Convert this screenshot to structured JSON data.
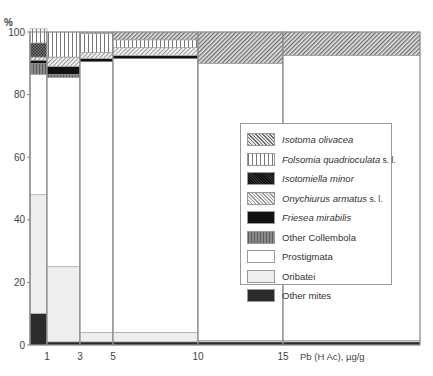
{
  "chart_data": {
    "type": "bar",
    "subtype": "stacked-100-percent-variable-width",
    "title": "",
    "ylabel": "%",
    "xlabel": "Pb (H Ac), µg/g",
    "ylim": [
      0,
      100
    ],
    "yticks": [
      0,
      20,
      40,
      60,
      80,
      100
    ],
    "xticks": [
      "1",
      "3",
      "5",
      "10",
      "15"
    ],
    "grid": false,
    "legend_position": "inside-right",
    "bars": [
      {
        "x_from": 0,
        "x_to": 1,
        "segments": {
          "Other mites": 10,
          "Oribatei": 38,
          "Prostigmata": 38.5,
          "Other Collembola": 3.5,
          "Friesea mirabilis": 1,
          "Onychiurus armatus s. l.": 1,
          "Isotomiella minor": 4.5,
          "Folsomia quadrioculata s. l.": 4.5,
          "Isotoma olivacea": 0
        }
      },
      {
        "x_from": 1,
        "x_to": 3,
        "segments": {
          "Other mites": 1,
          "Oribatei": 24,
          "Prostigmata": 60.5,
          "Other Collembola": 1,
          "Friesea mirabilis": 2.5,
          "Onychiurus armatus s. l.": 3,
          "Isotomiella minor": 0,
          "Folsomia quadrioculata s. l.": 8,
          "Isotoma olivacea": 0
        }
      },
      {
        "x_from": 3,
        "x_to": 5,
        "segments": {
          "Other mites": 1,
          "Oribatei": 3,
          "Prostigmata": 86.5,
          "Other Collembola": 0,
          "Friesea mirabilis": 1,
          "Onychiurus armatus s. l.": 2,
          "Isotomiella minor": 0,
          "Folsomia quadrioculata s. l.": 6,
          "Isotoma olivacea": 0.5
        }
      },
      {
        "x_from": 5,
        "x_to": 10,
        "segments": {
          "Other mites": 1,
          "Oribatei": 3,
          "Prostigmata": 87.5,
          "Other Collembola": 0,
          "Friesea mirabilis": 1,
          "Onychiurus armatus s. l.": 2.5,
          "Isotomiella minor": 0,
          "Folsomia quadrioculata s. l.": 2.5,
          "Isotoma olivacea": 2.5
        }
      },
      {
        "x_from": 10,
        "x_to": 15,
        "segments": {
          "Other mites": 1,
          "Oribatei": 0.5,
          "Prostigmata": 88.5,
          "Other Collembola": 0,
          "Friesea mirabilis": 0,
          "Onychiurus armatus s. l.": 0,
          "Isotomiella minor": 0,
          "Folsomia quadrioculata s. l.": 0,
          "Isotoma olivacea": 10
        }
      },
      {
        "x_from": 15,
        "x_to": 20,
        "segments": {
          "Other mites": 1,
          "Oribatei": 0.5,
          "Prostigmata": 91,
          "Other Collembola": 0,
          "Friesea mirabilis": 0,
          "Onychiurus armatus s. l.": 0,
          "Isotomiella minor": 0,
          "Folsomia quadrioculata s. l.": 0,
          "Isotoma olivacea": 7.5
        }
      }
    ],
    "series_order_bottom_to_top": [
      "Other mites",
      "Oribatei",
      "Prostigmata",
      "Other Collembola",
      "Friesea mirabilis",
      "Onychiurus armatus s. l.",
      "Isotomiella minor",
      "Folsomia quadrioculata s. l.",
      "Isotoma olivacea"
    ]
  },
  "axis": {
    "y_unit": "%",
    "y_ticks": [
      "0",
      "20",
      "40",
      "60",
      "80",
      "100"
    ],
    "x_ticks": [
      "1",
      "3",
      "5",
      "10",
      "15"
    ],
    "x_title": "Pb (H Ac), µg/g"
  },
  "legend": [
    {
      "name": "Isotoma olivacea",
      "suffix": "",
      "italic": true,
      "pattern": "diag-fine"
    },
    {
      "name": "Folsomia quadrioculata",
      "suffix": " s. l.",
      "italic": true,
      "pattern": "vertical"
    },
    {
      "name": "Isotomiella minor",
      "suffix": "",
      "italic": true,
      "pattern": "crosshatch"
    },
    {
      "name": "Onychiurus armatus",
      "suffix": " s. l.",
      "italic": true,
      "pattern": "diag-light"
    },
    {
      "name": "Friesea mirabilis",
      "suffix": "",
      "italic": true,
      "pattern": "black"
    },
    {
      "name": "Other Collembola",
      "suffix": "",
      "italic": false,
      "pattern": "gray-vertical"
    },
    {
      "name": "Prostigmata",
      "suffix": "",
      "italic": false,
      "pattern": "white"
    },
    {
      "name": "Oribatei",
      "suffix": "",
      "italic": false,
      "pattern": "light-gray"
    },
    {
      "name": "Other  mites",
      "suffix": "",
      "italic": false,
      "pattern": "dark"
    }
  ]
}
